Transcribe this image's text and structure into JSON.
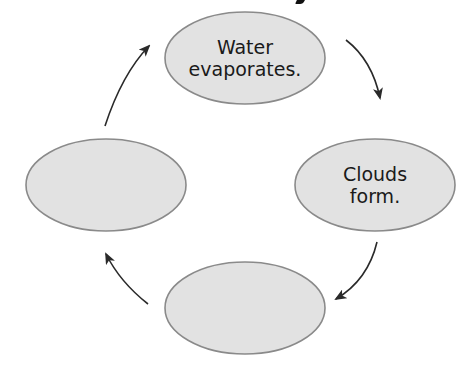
{
  "diagram": {
    "type": "cycle",
    "title_fragment_visible": true,
    "colors": {
      "node_fill": "#e2e2e2",
      "node_stroke": "#8a8a8a",
      "arrow": "#2a2a2a",
      "text": "#1a1a1a"
    },
    "nodes": [
      {
        "id": "top",
        "position": "top",
        "line1": "Water",
        "line2": "evaporates."
      },
      {
        "id": "right",
        "position": "right",
        "line1": "Clouds",
        "line2": "form."
      },
      {
        "id": "bottom",
        "position": "bottom",
        "line1": "",
        "line2": ""
      },
      {
        "id": "left",
        "position": "left",
        "line1": "",
        "line2": ""
      }
    ],
    "arrows": [
      {
        "from": "top",
        "to": "right",
        "direction": "clockwise"
      },
      {
        "from": "right",
        "to": "bottom",
        "direction": "clockwise"
      },
      {
        "from": "bottom",
        "to": "left",
        "direction": "clockwise"
      },
      {
        "from": "left",
        "to": "top",
        "direction": "clockwise"
      }
    ]
  }
}
